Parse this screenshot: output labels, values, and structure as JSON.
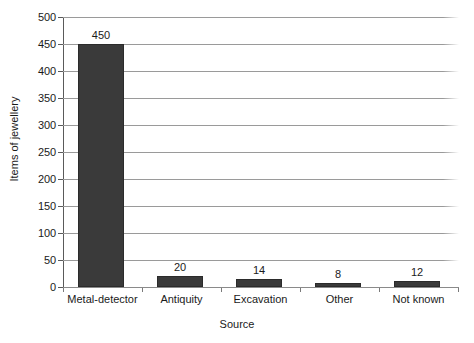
{
  "chart_data": {
    "type": "bar",
    "title": "",
    "subtitle": "",
    "xlabel": "Source",
    "ylabel": "Items of jewellery",
    "categories": [
      "Metal-detector",
      "Antiquity",
      "Excavation",
      "Other",
      "Not known"
    ],
    "values": [
      450,
      20,
      14,
      8,
      12
    ],
    "data_labels": [
      "450",
      "20",
      "14",
      "8",
      "12"
    ],
    "ylim": [
      0,
      500
    ],
    "ytick_step": 50,
    "ytick_labels": [
      "0",
      "50",
      "100",
      "150",
      "200",
      "250",
      "300",
      "350",
      "400",
      "450",
      "500"
    ],
    "ytick_values": [
      0,
      50,
      100,
      150,
      200,
      250,
      300,
      350,
      400,
      450,
      500
    ],
    "grid": true,
    "grid_axis": "y",
    "legend": false,
    "legend_position": "none",
    "bar_color": "#3a3a3a",
    "grid_color": "#9a9a9a",
    "axis_color": "#5a5a5a",
    "background_color": "#ffffff",
    "text_color": "#1a1a1a"
  }
}
